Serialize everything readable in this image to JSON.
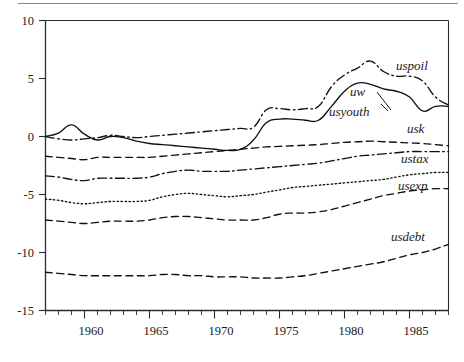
{
  "figure": {
    "has_top_rule": true,
    "background_color": "#ffffff",
    "line_color": "#111111"
  },
  "chart_data": {
    "type": "line",
    "title": "",
    "subtitle": "",
    "xlabel": "",
    "ylabel": "",
    "xlim": [
      1957,
      1988
    ],
    "ylim": [
      -15,
      10
    ],
    "grid": false,
    "legend": "inline-labels-at-right",
    "y_ticks": [
      10,
      5,
      0,
      -5,
      -10,
      -15
    ],
    "y_tick_labels": [
      "10",
      "5",
      "0",
      "-5",
      "-10",
      "-15"
    ],
    "x_ticks": [
      1960,
      1965,
      1970,
      1975,
      1980,
      1985
    ],
    "x_tick_labels": [
      "1960",
      "1965",
      "1970",
      "1975",
      "1980",
      "1985"
    ],
    "x_minor_tick_interval": 1,
    "x": [
      1957,
      1958,
      1959,
      1960,
      1961,
      1962,
      1963,
      1964,
      1965,
      1966,
      1967,
      1968,
      1969,
      1970,
      1971,
      1972,
      1973,
      1974,
      1975,
      1976,
      1977,
      1978,
      1979,
      1980,
      1981,
      1982,
      1983,
      1984,
      1985,
      1986,
      1987,
      1988
    ],
    "series": [
      {
        "name": "uspoil",
        "label": "uspoil",
        "line_style": "dash-dot",
        "values": [
          0.0,
          -0.2,
          -0.3,
          -0.2,
          -0.1,
          0.1,
          0.0,
          -0.1,
          0.0,
          0.1,
          0.2,
          0.3,
          0.4,
          0.5,
          0.6,
          0.7,
          0.8,
          2.3,
          2.4,
          2.3,
          2.4,
          2.6,
          4.3,
          5.3,
          5.9,
          6.5,
          5.6,
          5.2,
          5.2,
          4.8,
          3.4,
          2.7
        ]
      },
      {
        "name": "uw",
        "label": "uw",
        "line_style": "solid",
        "values": [
          0.0,
          0.3,
          1.0,
          0.2,
          -0.3,
          0.0,
          -0.1,
          -0.4,
          -0.6,
          -0.7,
          -0.8,
          -0.9,
          -1.0,
          -1.1,
          -1.2,
          -1.1,
          -0.3,
          1.2,
          1.5,
          1.5,
          1.4,
          1.4,
          2.6,
          3.9,
          4.6,
          4.5,
          4.1,
          3.9,
          3.4,
          2.2,
          2.6,
          2.6
        ]
      },
      {
        "name": "usyouth",
        "label": "usyouth",
        "line_style": "dashed",
        "values": [
          -1.7,
          -1.8,
          -1.9,
          -2.0,
          -1.8,
          -1.8,
          -1.8,
          -1.8,
          -1.8,
          -1.7,
          -1.6,
          -1.5,
          -1.4,
          -1.3,
          -1.2,
          -1.1,
          -1.0,
          -0.9,
          -0.85,
          -0.8,
          -0.75,
          -0.7,
          -0.6,
          -0.5,
          -0.45,
          -0.4,
          -0.45,
          -0.5,
          -0.55,
          -0.6,
          -0.7,
          -0.8
        ]
      },
      {
        "name": "usk",
        "label": "usk",
        "line_style": "dash-dot",
        "values": [
          -3.4,
          -3.5,
          -3.7,
          -3.8,
          -3.6,
          -3.6,
          -3.6,
          -3.6,
          -3.5,
          -3.2,
          -3.0,
          -2.9,
          -3.0,
          -3.0,
          -3.0,
          -2.9,
          -2.8,
          -2.7,
          -2.6,
          -2.5,
          -2.4,
          -2.3,
          -2.1,
          -1.9,
          -1.7,
          -1.6,
          -1.5,
          -1.4,
          -1.3,
          -1.3,
          -1.3,
          -1.3
        ]
      },
      {
        "name": "ustax",
        "label": "ustax",
        "line_style": "dotted",
        "values": [
          -5.4,
          -5.5,
          -5.7,
          -5.8,
          -5.7,
          -5.6,
          -5.6,
          -5.6,
          -5.5,
          -5.2,
          -5.0,
          -4.9,
          -5.0,
          -5.1,
          -5.2,
          -5.1,
          -5.0,
          -4.8,
          -4.6,
          -4.4,
          -4.3,
          -4.2,
          -4.1,
          -4.0,
          -3.9,
          -3.8,
          -3.7,
          -3.5,
          -3.3,
          -3.2,
          -3.1,
          -3.1
        ]
      },
      {
        "name": "usexp",
        "label": "usexp",
        "line_style": "dashed",
        "values": [
          -7.2,
          -7.3,
          -7.4,
          -7.5,
          -7.4,
          -7.3,
          -7.3,
          -7.3,
          -7.2,
          -7.0,
          -6.9,
          -6.9,
          -7.0,
          -7.1,
          -7.2,
          -7.2,
          -7.2,
          -7.0,
          -6.7,
          -6.6,
          -6.6,
          -6.5,
          -6.3,
          -6.0,
          -5.7,
          -5.4,
          -5.1,
          -4.9,
          -4.7,
          -4.6,
          -4.5,
          -4.5
        ]
      },
      {
        "name": "usdebt",
        "label": "usdebt",
        "line_style": "dashed",
        "values": [
          -11.7,
          -11.8,
          -11.9,
          -12.0,
          -12.0,
          -12.0,
          -12.0,
          -12.0,
          -12.0,
          -11.9,
          -11.9,
          -12.0,
          -12.0,
          -12.1,
          -12.1,
          -12.1,
          -12.2,
          -12.2,
          -12.2,
          -12.1,
          -12.0,
          -11.8,
          -11.6,
          -11.4,
          -11.2,
          -11.0,
          -10.8,
          -10.5,
          -10.2,
          -10.0,
          -9.7,
          -9.3
        ]
      }
    ]
  },
  "labels": {
    "uspoil": "uspoil",
    "uw": "uw",
    "usyouth": "usyouth",
    "usk": "usk",
    "ustax": "ustax",
    "usexp": "usexp",
    "usdebt": "usdebt"
  },
  "y_axis": {
    "t0": "10",
    "t1": "5",
    "t2": "0",
    "t3": "-5",
    "t4": "-10",
    "t5": "-15"
  },
  "x_axis": {
    "t0": "1960",
    "t1": "1965",
    "t2": "1970",
    "t3": "1975",
    "t4": "1980",
    "t5": "1985"
  }
}
